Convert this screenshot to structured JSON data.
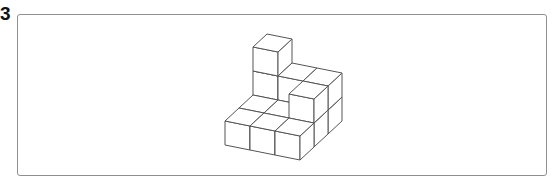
{
  "question": {
    "number": "3"
  },
  "figure": {
    "colors": {
      "edge": "#555555",
      "face": "#ffffff",
      "border": "#8f8f8f"
    },
    "grid_axes": {
      "x": "left to right",
      "y": "front to back"
    },
    "column_heights": [
      {
        "x": 0,
        "y": 0,
        "h": 1
      },
      {
        "x": 1,
        "y": 0,
        "h": 1
      },
      {
        "x": 2,
        "y": 0,
        "h": 1
      },
      {
        "x": 0,
        "y": 1,
        "h": 1
      },
      {
        "x": 1,
        "y": 1,
        "h": 1
      },
      {
        "x": 2,
        "y": 1,
        "h": 2
      },
      {
        "x": 0,
        "y": 2,
        "h": 3
      },
      {
        "x": 1,
        "y": 2,
        "h": 2
      },
      {
        "x": 2,
        "y": 2,
        "h": 2
      }
    ],
    "total_cubes": 14
  }
}
